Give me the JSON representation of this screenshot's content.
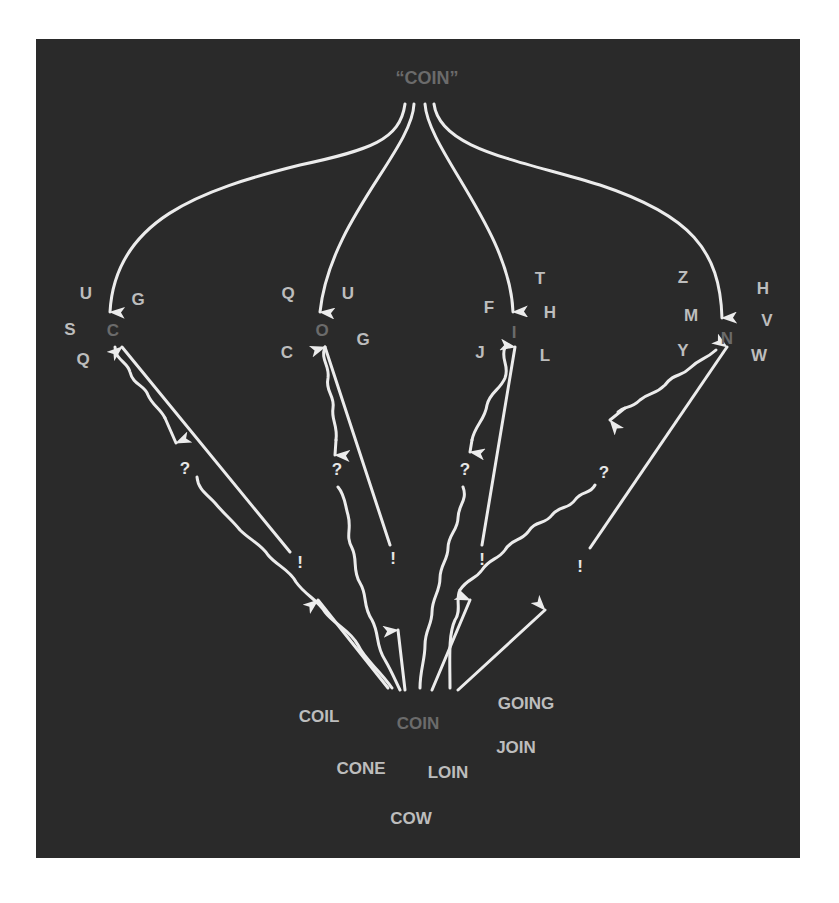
{
  "diagram": {
    "title_word": "“COIN”",
    "colors": {
      "panel_bg": "#2a2a2a",
      "page_bg": "#ffffff",
      "arrow": "#ececec",
      "target_text": "#6b6b6b",
      "candidate_text": "#bdbdbd"
    },
    "branches": [
      {
        "target": "C",
        "candidates": [
          "U",
          "G",
          "S",
          "Q"
        ],
        "query_mark": "?",
        "confirm_mark": "!"
      },
      {
        "target": "O",
        "candidates": [
          "Q",
          "U",
          "C",
          "G"
        ],
        "query_mark": "?",
        "confirm_mark": "!"
      },
      {
        "target": "I",
        "candidates": [
          "T",
          "F",
          "H",
          "J",
          "L"
        ],
        "query_mark": "?",
        "confirm_mark": "!"
      },
      {
        "target": "N",
        "candidates": [
          "Z",
          "H",
          "M",
          "V",
          "Y",
          "W"
        ],
        "query_mark": "?",
        "confirm_mark": "!"
      }
    ],
    "hub": {
      "word": "COIN",
      "candidates": [
        "COIL",
        "GOING",
        "JOIN",
        "CONE",
        "LOIN",
        "COW"
      ]
    }
  }
}
